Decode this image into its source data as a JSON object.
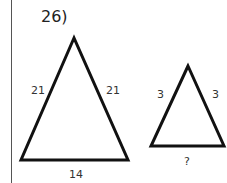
{
  "problem": {
    "number_label": "26)"
  },
  "large_triangle": {
    "left_side": "21",
    "right_side": "21",
    "base": "14"
  },
  "small_triangle": {
    "left_side": "3",
    "right_side": "3",
    "base": "?"
  }
}
